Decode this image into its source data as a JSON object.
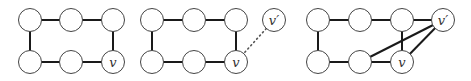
{
  "figure": {
    "panels": [
      {
        "id": "panel-1",
        "nodes": [
          {
            "id": "a1",
            "x": 30,
            "y": 20,
            "label": ""
          },
          {
            "id": "a2",
            "x": 71,
            "y": 20,
            "label": ""
          },
          {
            "id": "a3",
            "x": 113,
            "y": 20,
            "label": ""
          },
          {
            "id": "b1",
            "x": 30,
            "y": 62,
            "label": ""
          },
          {
            "id": "b2",
            "x": 71,
            "y": 62,
            "label": ""
          },
          {
            "id": "b3",
            "x": 113,
            "y": 62,
            "label": "v"
          }
        ],
        "edges": [
          [
            "a1",
            "a2"
          ],
          [
            "a2",
            "a3"
          ],
          [
            "a1",
            "b1"
          ],
          [
            "a3",
            "b3"
          ],
          [
            "b1",
            "b2"
          ],
          [
            "b2",
            "b3"
          ]
        ],
        "dotted_edges": []
      },
      {
        "id": "panel-2",
        "nodes": [
          {
            "id": "a1",
            "x": 152,
            "y": 20,
            "label": ""
          },
          {
            "id": "a2",
            "x": 194,
            "y": 20,
            "label": ""
          },
          {
            "id": "a3",
            "x": 236,
            "y": 20,
            "label": ""
          },
          {
            "id": "b1",
            "x": 152,
            "y": 62,
            "label": ""
          },
          {
            "id": "b2",
            "x": 194,
            "y": 62,
            "label": ""
          },
          {
            "id": "b3",
            "x": 236,
            "y": 62,
            "label": "v"
          },
          {
            "id": "vp",
            "x": 274,
            "y": 20,
            "label": "v′"
          }
        ],
        "edges": [
          [
            "a1",
            "a2"
          ],
          [
            "a2",
            "a3"
          ],
          [
            "a1",
            "b1"
          ],
          [
            "a3",
            "b3"
          ],
          [
            "b1",
            "b2"
          ],
          [
            "b2",
            "b3"
          ]
        ],
        "dotted_edges": [
          [
            "b3",
            "vp"
          ]
        ]
      },
      {
        "id": "panel-3",
        "nodes": [
          {
            "id": "a1",
            "x": 318,
            "y": 20,
            "label": ""
          },
          {
            "id": "a2",
            "x": 360,
            "y": 20,
            "label": ""
          },
          {
            "id": "a3",
            "x": 402,
            "y": 20,
            "label": ""
          },
          {
            "id": "b1",
            "x": 318,
            "y": 62,
            "label": ""
          },
          {
            "id": "b2",
            "x": 360,
            "y": 62,
            "label": ""
          },
          {
            "id": "b3",
            "x": 402,
            "y": 62,
            "label": "v"
          },
          {
            "id": "vp",
            "x": 443,
            "y": 20,
            "label": "v′"
          }
        ],
        "edges": [
          [
            "a1",
            "a2"
          ],
          [
            "a2",
            "a3"
          ],
          [
            "a3",
            "vp"
          ],
          [
            "a1",
            "b1"
          ],
          [
            "a3",
            "b3"
          ],
          [
            "b1",
            "b2"
          ],
          [
            "b2",
            "b3"
          ],
          [
            "b2",
            "vp"
          ],
          [
            "b3",
            "vp"
          ]
        ],
        "dotted_edges": []
      }
    ],
    "node_radius": 11.5,
    "colors": {
      "edge": "#1a1a1a",
      "node_stroke": "#444444",
      "node_fill": "#ffffff",
      "label": "#333333"
    }
  }
}
